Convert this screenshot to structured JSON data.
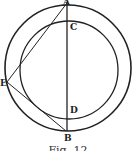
{
  "figure": {
    "caption": "Fig. 12",
    "labels": {
      "A": "A",
      "B": "B",
      "C": "C",
      "D": "D",
      "E": "E"
    },
    "stroke_color": "#222222"
  }
}
